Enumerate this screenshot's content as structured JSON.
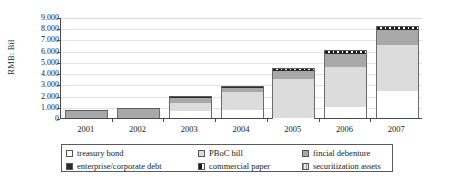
{
  "chart_data": {
    "type": "bar",
    "stacked": true,
    "title": "",
    "xlabel": "",
    "ylabel": "RMB: Bil",
    "ylim": [
      0,
      9000
    ],
    "ytick_labels": [
      "9.000",
      "8.000",
      "7.000",
      "6.000",
      "5.000",
      "4.000",
      "3.000",
      "2.000",
      "1.000",
      "0"
    ],
    "ytick_values": [
      9000,
      8000,
      7000,
      6000,
      5000,
      4000,
      3000,
      2000,
      1000,
      0
    ],
    "grid": true,
    "legend_position": "bottom",
    "categories": [
      "2001",
      "2002",
      "2003",
      "2004",
      "2005",
      "2006",
      "2007"
    ],
    "series": [
      {
        "name": "treasury bond",
        "color": "#ffffff",
        "values": [
          0,
          0,
          650,
          700,
          40,
          980,
          2400
        ]
      },
      {
        "name": "PBoC bill",
        "color": "#dcdcdc",
        "values": [
          0,
          0,
          700,
          1600,
          3450,
          3600,
          4150
        ]
      },
      {
        "name": "fincial debenture",
        "color": "#a8a8a8",
        "values": [
          620,
          780,
          460,
          410,
          700,
          1100,
          1300
        ]
      },
      {
        "name": "enterprise/corporate debt",
        "color": "#2b2b2b",
        "values": [
          70,
          80,
          130,
          110,
          90,
          110,
          120
        ]
      },
      {
        "name": "commercial paper",
        "color": "#1c1c1c",
        "values": [
          0,
          0,
          0,
          0,
          180,
          250,
          220
        ]
      },
      {
        "name": "securitization assets",
        "color": "#bdbdbd",
        "values": [
          0,
          0,
          0,
          0,
          0,
          0,
          0
        ]
      }
    ],
    "totals": [
      690,
      860,
      1940,
      2820,
      4460,
      6040,
      8190
    ]
  },
  "legend": {
    "items": [
      {
        "label": "treasury bond",
        "swatch": "treasury-bond-swatch"
      },
      {
        "label": "PBoC bill",
        "swatch": "pboc-bill-swatch"
      },
      {
        "label": "fincial debenture",
        "swatch": "fincial-debenture-swatch"
      },
      {
        "label": "enterprise/corporate debt",
        "swatch": "enterprise-corporate-debt-swatch"
      },
      {
        "label": "commercial paper",
        "swatch": "commercial-paper-swatch"
      },
      {
        "label": "securitization assets",
        "swatch": "securitization-assets-swatch"
      }
    ]
  }
}
